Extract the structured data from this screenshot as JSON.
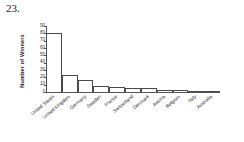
{
  "problem": {
    "number": "23."
  },
  "chart_data": {
    "type": "bar",
    "title": "",
    "xlabel": "",
    "ylabel": "Number of Winners",
    "ylim": [
      0,
      90
    ],
    "ytick_step": 10,
    "yticks": [
      "90",
      "80",
      "70",
      "60",
      "50",
      "40",
      "30",
      "20",
      "10",
      "0"
    ],
    "grid": false,
    "legend": "none",
    "categories": [
      "United States",
      "United Kingdom",
      "Germany",
      "Sweden",
      "France",
      "Switzerland",
      "Denmark",
      "Austria",
      "Belgium",
      "Italy",
      "Australia"
    ],
    "values": [
      80,
      23,
      16,
      8,
      7,
      6,
      5,
      3,
      3,
      2,
      2
    ]
  },
  "style": {
    "bar_fill": "#ffffff",
    "bar_stroke": "#4a4a4a",
    "axis_color": "#555555",
    "text_color": "#2b2b2b",
    "background": "#ffffff"
  }
}
